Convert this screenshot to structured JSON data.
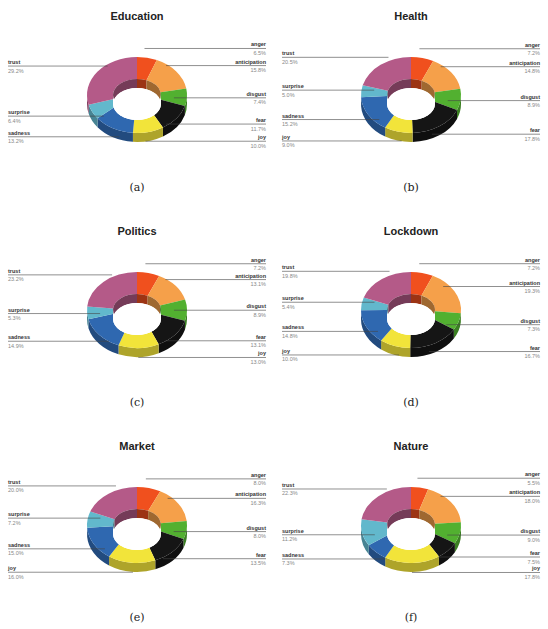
{
  "chart_data": [
    {
      "type": "pie",
      "subtype": "3d-donut",
      "title": "Education",
      "caption": "(a)",
      "categories": [
        "anger",
        "anticipation",
        "disgust",
        "fear",
        "joy",
        "sadness",
        "surprise",
        "trust"
      ],
      "values": [
        6.5,
        15.8,
        7.4,
        11.7,
        10.0,
        13.2,
        6.4,
        29.2
      ],
      "labels": [
        "6.5%",
        "15.8%",
        "7.4%",
        "11.7%",
        "10.0%",
        "13.2%",
        "6.4%",
        "29.2%"
      ]
    },
    {
      "type": "pie",
      "subtype": "3d-donut",
      "title": "Health",
      "caption": "(b)",
      "categories": [
        "anger",
        "anticipation",
        "disgust",
        "fear",
        "joy",
        "sadness",
        "surprise",
        "trust"
      ],
      "values": [
        7.2,
        14.8,
        8.9,
        17.8,
        9.0,
        15.2,
        5.0,
        20.5
      ],
      "labels": [
        "7.2%",
        "14.8%",
        "8.9%",
        "17.8%",
        "9.0%",
        "15.2%",
        "5.0%",
        "20.5%"
      ]
    },
    {
      "type": "pie",
      "subtype": "3d-donut",
      "title": "Politics",
      "caption": "(c)",
      "categories": [
        "anger",
        "anticipation",
        "disgust",
        "fear",
        "joy",
        "sadness",
        "surprise",
        "trust"
      ],
      "values": [
        7.2,
        13.1,
        8.9,
        13.1,
        13.0,
        14.9,
        5.3,
        23.2
      ],
      "labels": [
        "7.2%",
        "13.1%",
        "8.9%",
        "13.1%",
        "13.0%",
        "14.9%",
        "5.3%",
        "23.2%"
      ]
    },
    {
      "type": "pie",
      "subtype": "3d-donut",
      "title": "Lockdown",
      "caption": "(d)",
      "categories": [
        "anger",
        "anticipation",
        "disgust",
        "fear",
        "joy",
        "sadness",
        "surprise",
        "trust"
      ],
      "values": [
        7.2,
        19.3,
        7.3,
        16.7,
        10.0,
        14.8,
        5.4,
        19.8
      ],
      "labels": [
        "7.2%",
        "19.3%",
        "7.3%",
        "16.7%",
        "10.0%",
        "14.8%",
        "5.4%",
        "19.8%"
      ]
    },
    {
      "type": "pie",
      "subtype": "3d-donut",
      "title": "Market",
      "caption": "(e)",
      "categories": [
        "anger",
        "anticipation",
        "disgust",
        "fear",
        "joy",
        "sadness",
        "surprise",
        "trust"
      ],
      "values": [
        8.0,
        16.3,
        8.0,
        13.5,
        16.0,
        15.0,
        7.2,
        20.0
      ],
      "labels": [
        "8.0%",
        "16.3%",
        "8.0%",
        "13.5%",
        "16.0%",
        "15.0%",
        "7.2%",
        "20.0%"
      ]
    },
    {
      "type": "pie",
      "subtype": "3d-donut",
      "title": "Nature",
      "caption": "(f)",
      "categories": [
        "anger",
        "anticipation",
        "disgust",
        "fear",
        "joy",
        "sadness",
        "surprise",
        "trust"
      ],
      "values": [
        5.5,
        18.0,
        9.0,
        7.5,
        17.8,
        7.3,
        11.2,
        22.3
      ],
      "labels": [
        "5.5%",
        "18.0%",
        "9.0%",
        "7.5%",
        "17.8%",
        "7.3%",
        "11.2%",
        "22.3%"
      ]
    }
  ],
  "colors": {
    "anger": "#f0501e",
    "anticipation": "#f5a04a",
    "disgust": "#52b030",
    "fear": "#151515",
    "joy": "#f2e43a",
    "sadness": "#2f68b0",
    "surprise": "#62b8cc",
    "trust": "#b45a88"
  }
}
